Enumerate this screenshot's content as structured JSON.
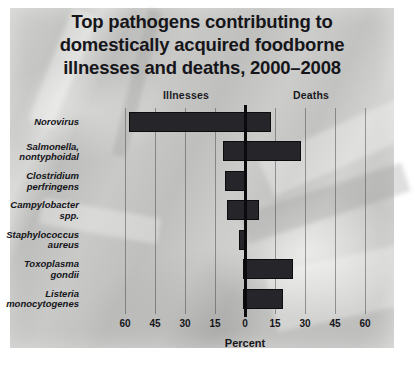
{
  "title": {
    "line1": "Top pathogens contributing to",
    "line2": "domestically acquired foodborne",
    "line3": "illnesses and deaths, 2000–2008"
  },
  "column_headers": {
    "left": "Illnesses",
    "right": "Deaths"
  },
  "axis": {
    "label": "Percent",
    "ticks": [
      "60",
      "45",
      "30",
      "15",
      "0",
      "15",
      "30",
      "45",
      "60"
    ]
  },
  "colors": {
    "bar": "#25252a",
    "bar_border": "#0c0c0e",
    "zero_line": "#0b0b0d",
    "grid_line": "#464648",
    "text": "#16161a",
    "panel_light": "#d6d6d4",
    "panel_dark": "#bdbdbb"
  },
  "chart_data": {
    "type": "bar",
    "orientation": "horizontal-diverging",
    "title": "Top pathogens contributing to domestically acquired foodborne illnesses and deaths, 2000–2008",
    "xlabel": "Percent",
    "ylabel": "",
    "xlim": [
      -60,
      60
    ],
    "xticks": [
      -60,
      -45,
      -30,
      -15,
      0,
      15,
      30,
      45,
      60
    ],
    "xticklabels": [
      "60",
      "45",
      "30",
      "15",
      "0",
      "15",
      "30",
      "45",
      "60"
    ],
    "grid": true,
    "legend": "none",
    "series": [
      {
        "name": "Illnesses",
        "side": "left",
        "values": [
          58,
          11,
          10,
          9,
          3,
          1,
          1
        ]
      },
      {
        "name": "Deaths",
        "side": "right",
        "values": [
          13,
          28,
          1,
          7,
          1,
          24,
          19
        ]
      }
    ],
    "categories": [
      "Norovirus",
      "Salmonella, nontyphoidal",
      "Clostridium perfringens",
      "Campylobacter spp.",
      "Staphylococcus aureus",
      "Toxoplasma gondii",
      "Listeria monocytogenes"
    ],
    "category_lines": [
      [
        "Norovirus"
      ],
      [
        "Salmonella,",
        "nontyphoidal"
      ],
      [
        "Clostridium",
        "perfringens"
      ],
      [
        "Campylobacter",
        "spp."
      ],
      [
        "Staphylococcus",
        "aureus"
      ],
      [
        "Toxoplasma",
        "gondii"
      ],
      [
        "Listeria",
        "monocytogenes"
      ]
    ]
  }
}
